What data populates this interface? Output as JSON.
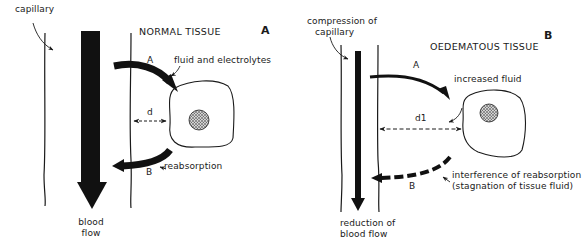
{
  "figure": {
    "panel_a": {
      "letter": "A",
      "title": "NORMAL TISSUE",
      "capillary_label": "capillary",
      "arrow_a_label": "A",
      "arrow_a_text": "fluid and electrolytes",
      "distance_label": "d",
      "arrow_b_label": "B",
      "arrow_b_text": "reabsorption",
      "flow_label_line1": "blood",
      "flow_label_line2": "flow"
    },
    "panel_b": {
      "letter": "B",
      "title": "OEDEMATOUS TISSUE",
      "capillary_label_line1": "compression of",
      "capillary_label_line2": "capillary",
      "arrow_a_label": "A",
      "arrow_a_text": "increased fluid",
      "distance_label": "d",
      "distance_subscript": "1",
      "arrow_b_label": "B",
      "arrow_b_text_line1": "interference of reabsorption",
      "arrow_b_text_line2": "(stagnation of tissue fluid)",
      "flow_label_line1": "reduction of",
      "flow_label_line2": "blood flow"
    },
    "colors": {
      "ink": "#1a1a1a",
      "background": "#ffffff"
    }
  }
}
